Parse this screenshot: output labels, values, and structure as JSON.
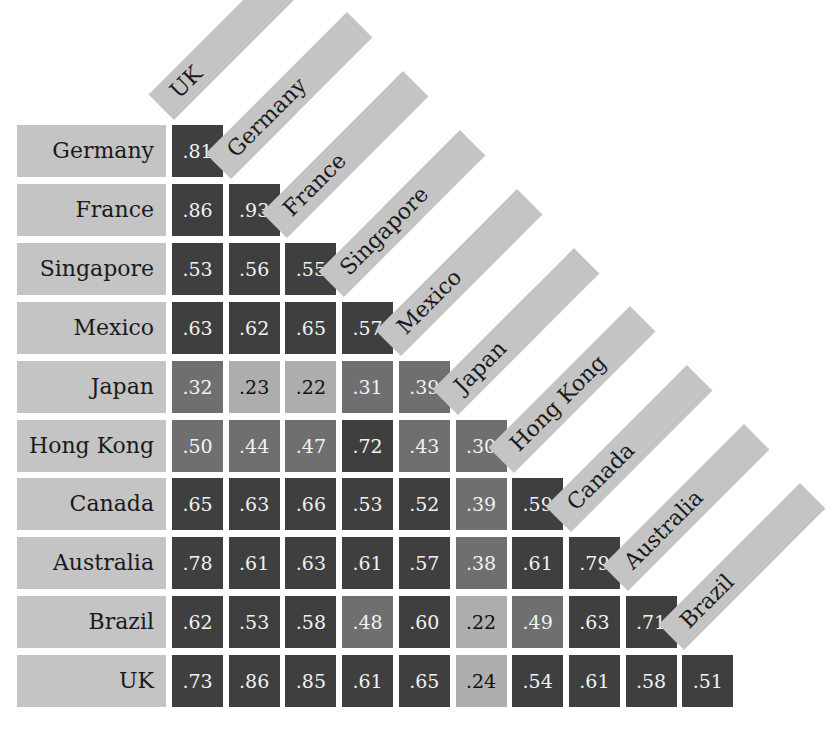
{
  "chart_data": {
    "type": "heatmap",
    "title": "",
    "subtitle": "",
    "layout": "lower-triangular correlation matrix with diagonal column headers",
    "columns": [
      "UK",
      "Germany",
      "France",
      "Singapore",
      "Mexico",
      "Japan",
      "Hong Kong",
      "Canada",
      "Australia",
      "Brazil"
    ],
    "rows": [
      "Germany",
      "France",
      "Singapore",
      "Mexico",
      "Japan",
      "Hong Kong",
      "Canada",
      "Australia",
      "Brazil",
      "UK"
    ],
    "values": [
      [
        ".81"
      ],
      [
        ".86",
        ".93"
      ],
      [
        ".53",
        ".56",
        ".55"
      ],
      [
        ".63",
        ".62",
        ".65",
        ".57"
      ],
      [
        ".32",
        ".23",
        ".22",
        ".31",
        ".39"
      ],
      [
        ".50",
        ".44",
        ".47",
        ".72",
        ".43",
        ".30"
      ],
      [
        ".65",
        ".63",
        ".66",
        ".53",
        ".52",
        ".39",
        ".59"
      ],
      [
        ".78",
        ".61",
        ".63",
        ".61",
        ".57",
        ".38",
        ".61",
        ".79"
      ],
      [
        ".62",
        ".53",
        ".58",
        ".48",
        ".60",
        ".22",
        ".49",
        ".63",
        ".71"
      ],
      [
        ".73",
        ".86",
        ".85",
        ".61",
        ".65",
        ".24",
        ".54",
        ".61",
        ".58",
        ".51"
      ]
    ],
    "shading": {
      "dark": {
        "rule": "> .50",
        "color": "#3f3f3f"
      },
      "mid": {
        "rule": ".25 - .50",
        "color": "#6f6f6f"
      },
      "light": {
        "rule": "< .25",
        "color": "#adadad"
      }
    },
    "label_background": "#c4c4c4",
    "grid": false,
    "legend": "none"
  }
}
